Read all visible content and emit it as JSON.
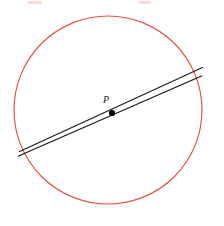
{
  "figure": {
    "background_color": "#ffffff",
    "width": 224,
    "height": 226,
    "point_label": "P",
    "colors": {
      "circle_stroke": "#e4563f",
      "chord_stroke": "#1a1a1a",
      "point_fill": "#000000",
      "label_fill": "#1a1a1a",
      "crop_artifact": "#e4563f"
    },
    "circle": {
      "center_x": 108,
      "center_y": 110,
      "radius": 94,
      "stroke_width": 1.2
    },
    "point": {
      "x": 112,
      "y": 113,
      "radius": 3.1,
      "label": "P",
      "label_x": 106,
      "label_y": 103
    },
    "chords": [
      {
        "name": "chord-upper",
        "x1": 19.5,
        "y1": 151.5,
        "x2": 202.5,
        "y2": 67.5,
        "stroke_width": 1.1
      },
      {
        "name": "chord-lower",
        "x1": 18.5,
        "y1": 156.0,
        "x2": 201.5,
        "y2": 76.0,
        "stroke_width": 1.3
      }
    ],
    "crop_artifacts": [
      {
        "name": "crop-artifact-left",
        "left": 28,
        "top": 1,
        "width": 14
      },
      {
        "name": "crop-artifact-right",
        "left": 139,
        "top": 1,
        "width": 12
      }
    ]
  }
}
